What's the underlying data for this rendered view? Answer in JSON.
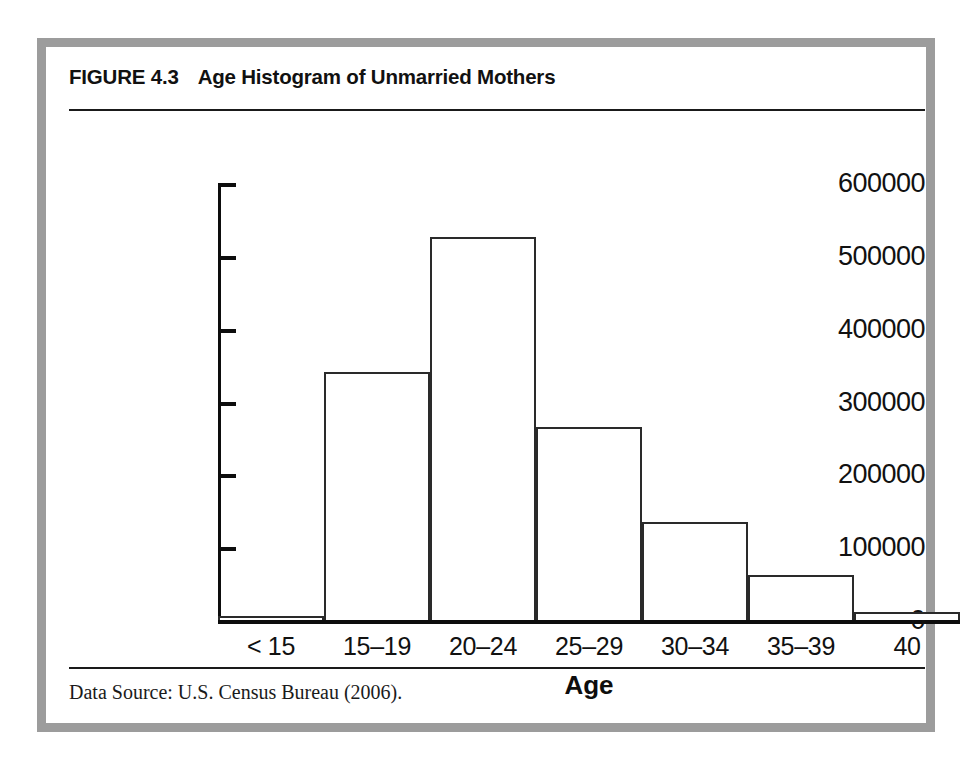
{
  "figure": {
    "label": "FIGURE 4.3",
    "title": "Age Histogram of Unmarried Mothers",
    "caption": "Data Source: U.S. Census Bureau (2006)."
  },
  "chart_data": {
    "type": "bar",
    "title": "Age Histogram of Unmarried Mothers",
    "xlabel": "Age",
    "ylabel": "",
    "categories": [
      "< 15",
      "15–19",
      "20–24",
      "25–29",
      "30–34",
      "35–39",
      "40"
    ],
    "values": [
      6000,
      340000,
      526000,
      265000,
      135000,
      62000,
      11000
    ],
    "ylim": [
      0,
      600000
    ],
    "yticks": [
      0,
      100000,
      200000,
      300000,
      400000,
      500000,
      600000
    ],
    "ytick_labels": [
      "0",
      "100000",
      "200000",
      "300000",
      "400000",
      "500000",
      "600000"
    ],
    "grid": false,
    "legend": false,
    "bar_fill_color": "#ffffff",
    "bar_edge_color": "#2a2a2a",
    "axis_color": "#0d0d0d"
  },
  "style": {
    "frame_color": "#9c9c9c",
    "rule_color": "#1a1a1a",
    "background": "#ffffff"
  }
}
